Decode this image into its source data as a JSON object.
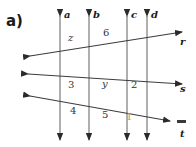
{
  "figure": {
    "part_label": "a)",
    "background_color": "#ffffff",
    "stroke_color": "#4a4a4a",
    "vertical_lines": [
      {
        "id": "a",
        "label": "a",
        "x": 60,
        "label_x": 64,
        "label_y": 10
      },
      {
        "id": "b",
        "label": "b",
        "x": 89,
        "label_x": 93,
        "label_y": 10
      },
      {
        "id": "c",
        "label": "c",
        "x": 127,
        "label_x": 131,
        "label_y": 10
      },
      {
        "id": "d",
        "label": "d",
        "x": 147,
        "label_x": 151,
        "label_y": 10
      }
    ],
    "transversals": [
      {
        "id": "r",
        "label": "r",
        "label_x": 180,
        "label_y": 41,
        "x1": 30,
        "y1": 56,
        "x2": 182,
        "y2": 32
      },
      {
        "id": "s",
        "label": "s",
        "label_x": 180,
        "label_y": 88,
        "x1": 28,
        "y1": 74,
        "x2": 182,
        "y2": 84
      },
      {
        "id": "t",
        "label": "t",
        "label_x": 180,
        "label_y": 124,
        "x1": 30,
        "y1": 96,
        "x2": 168,
        "y2": 120
      }
    ],
    "angle_labels": [
      {
        "id": "z",
        "text": "z",
        "x": 68,
        "y": 38,
        "style": "italic",
        "faint": false
      },
      {
        "id": "6",
        "text": "6",
        "x": 103,
        "y": 33,
        "style": "normal",
        "faint": false
      },
      {
        "id": "3",
        "text": "3",
        "x": 68,
        "y": 84,
        "style": "normal",
        "faint": false
      },
      {
        "id": "y",
        "text": "y",
        "x": 102,
        "y": 83,
        "style": "italic",
        "faint": false
      },
      {
        "id": "2",
        "text": "2",
        "x": 131,
        "y": 84,
        "style": "normal",
        "faint": false
      },
      {
        "id": "4",
        "text": "4",
        "x": 70,
        "y": 110,
        "style": "normal",
        "faint": false
      },
      {
        "id": "5",
        "text": "5",
        "x": 102,
        "y": 114,
        "style": "normal",
        "faint": false
      },
      {
        "id": "1",
        "text": "1",
        "x": 126,
        "y": 116,
        "style": "normal",
        "faint": true
      }
    ],
    "t_tick": {
      "x": 176,
      "y": 112,
      "width": 9,
      "height": 3
    }
  }
}
